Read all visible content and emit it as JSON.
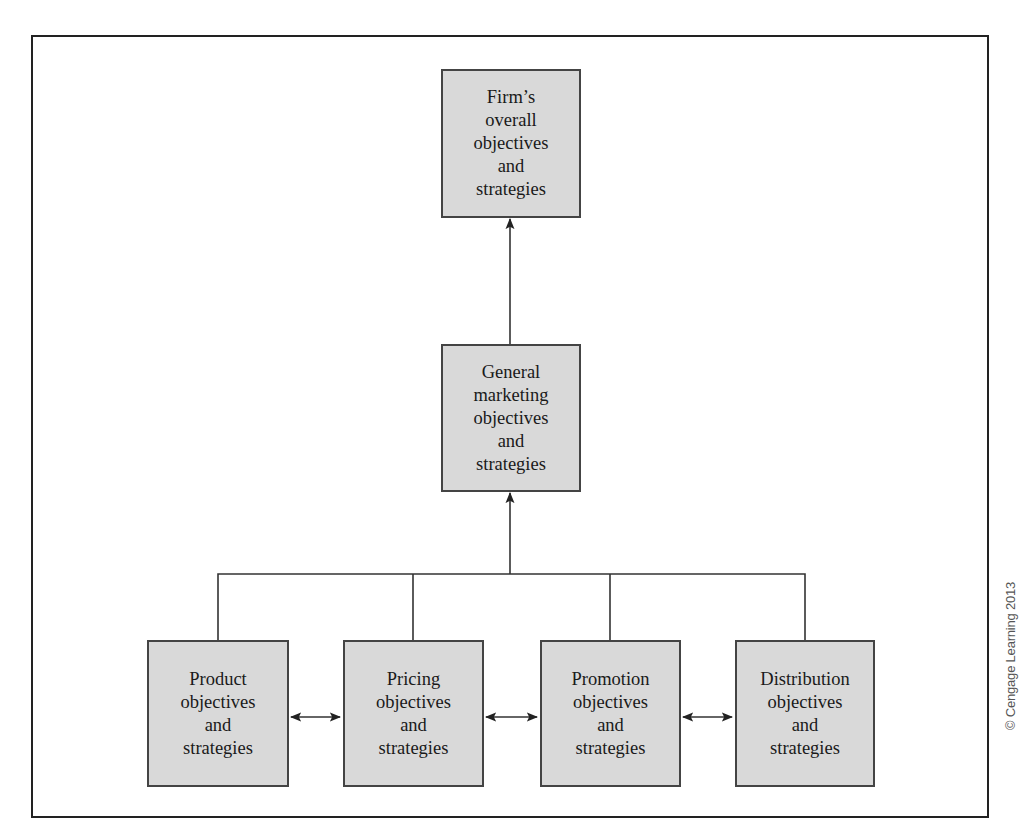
{
  "diagram": {
    "type": "hierarchy",
    "nodes": {
      "overall": {
        "lines": [
          "Firm’s",
          "overall",
          "objectives",
          "and",
          "strategies"
        ]
      },
      "marketing": {
        "lines": [
          "General",
          "marketing",
          "objectives",
          "and",
          "strategies"
        ]
      },
      "product": {
        "lines": [
          "Product",
          "objectives",
          "and",
          "strategies"
        ]
      },
      "pricing": {
        "lines": [
          "Pricing",
          "objectives",
          "and",
          "strategies"
        ]
      },
      "promotion": {
        "lines": [
          "Promotion",
          "objectives",
          "and",
          "strategies"
        ]
      },
      "distribution": {
        "lines": [
          "Distribution",
          "objectives",
          "and",
          "strategies"
        ]
      }
    },
    "edges": [
      {
        "from": "marketing",
        "to": "overall",
        "style": "arrow"
      },
      {
        "from": "product",
        "to": "marketing",
        "style": "bracket-arrow"
      },
      {
        "from": "pricing",
        "to": "marketing",
        "style": "bracket-arrow"
      },
      {
        "from": "promotion",
        "to": "marketing",
        "style": "bracket-arrow"
      },
      {
        "from": "distribution",
        "to": "marketing",
        "style": "bracket-arrow"
      },
      {
        "from": "product",
        "to": "pricing",
        "style": "double-arrow"
      },
      {
        "from": "pricing",
        "to": "promotion",
        "style": "double-arrow"
      },
      {
        "from": "promotion",
        "to": "distribution",
        "style": "double-arrow"
      }
    ],
    "colors": {
      "box_fill": "#d9d9d9",
      "box_border": "#444444",
      "line": "#333333"
    }
  },
  "credit": "© Cengage Learning 2013"
}
